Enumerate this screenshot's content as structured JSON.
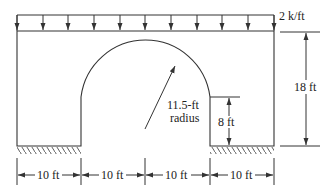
{
  "diagram": {
    "type": "structural-arch-frame",
    "load": {
      "label": "2 k/ft",
      "type": "uniformly distributed load",
      "arrow_count": 11
    },
    "arch": {
      "radius_label_line1": "11.5-ft",
      "radius_label_line2": "radius"
    },
    "dimensions": {
      "total_height": "18 ft",
      "support_height": "8 ft",
      "bottom_spans": [
        "10 ft",
        "10 ft",
        "10 ft",
        "10 ft"
      ]
    },
    "supports": [
      "fixed left base",
      "fixed right base"
    ],
    "colors": {
      "line": "#333333",
      "background": "#ffffff"
    }
  }
}
